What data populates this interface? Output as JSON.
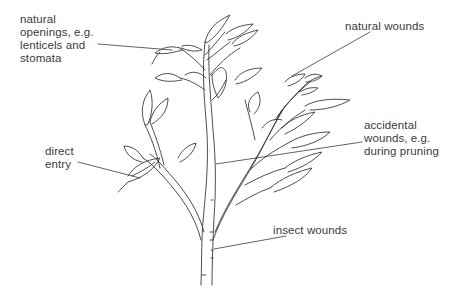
{
  "diagram": {
    "labels": [
      {
        "id": "natural-openings",
        "lines": [
          "natural",
          "openings, e.g.",
          "lenticels and",
          "stomata"
        ]
      },
      {
        "id": "natural-wounds",
        "lines": [
          "natural wounds"
        ]
      },
      {
        "id": "accidental-wounds",
        "lines": [
          "accidental",
          "wounds, e.g.",
          "during pruning"
        ]
      },
      {
        "id": "direct-entry",
        "lines": [
          "direct",
          "entry"
        ]
      },
      {
        "id": "insect-wounds",
        "lines": [
          "insect wounds"
        ]
      }
    ],
    "colors": {
      "line": "#3a3a3a",
      "background": "#ffffff"
    }
  }
}
